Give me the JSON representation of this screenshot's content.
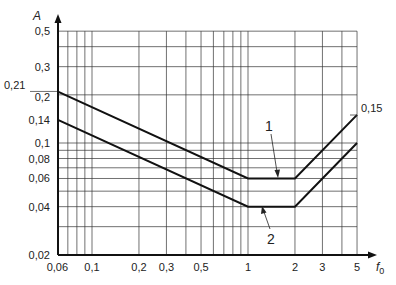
{
  "chart_data": {
    "type": "line",
    "title": "",
    "xlabel": "f0",
    "ylabel": "A",
    "xscale": "log",
    "yscale": "log",
    "xlim": [
      0.06,
      5
    ],
    "ylim": [
      0.02,
      0.5
    ],
    "grid": true,
    "x_tick_labels": [
      "0,06",
      "0,1",
      "0,2",
      "0,3",
      "0,5",
      "1",
      "2",
      "3",
      "5"
    ],
    "x_tick_values": [
      0.06,
      0.1,
      0.2,
      0.3,
      0.5,
      1,
      2,
      3,
      5
    ],
    "x_grid_values": [
      0.07,
      0.08,
      0.09,
      0.1,
      0.2,
      0.3,
      0.4,
      0.5,
      0.6,
      0.7,
      0.8,
      0.9,
      1,
      2,
      3,
      4,
      5
    ],
    "y_tick_labels": [
      "0,5",
      "0,3",
      "0,21",
      "0,2",
      "0,14",
      "0,1",
      "0,08",
      "0,06",
      "0,04",
      "0,02"
    ],
    "y_tick_values": [
      0.5,
      0.3,
      0.21,
      0.2,
      0.14,
      0.1,
      0.08,
      0.06,
      0.04,
      0.02
    ],
    "y_grid_values": [
      0.03,
      0.04,
      0.05,
      0.06,
      0.07,
      0.08,
      0.09,
      0.1,
      0.2,
      0.3,
      0.4,
      0.5
    ],
    "series": [
      {
        "name": "1",
        "x": [
          0.06,
          1,
          2,
          5
        ],
        "y": [
          0.21,
          0.06,
          0.06,
          0.15
        ]
      },
      {
        "name": "2",
        "x": [
          0.06,
          1,
          2,
          5
        ],
        "y": [
          0.14,
          0.04,
          0.04,
          0.1
        ]
      }
    ],
    "annotations": [
      {
        "text": "0,15",
        "x": 5,
        "y": 0.15
      },
      {
        "text": "1",
        "target_series": "1"
      },
      {
        "text": "2",
        "target_series": "2"
      }
    ]
  },
  "axes": {
    "x_label": "f",
    "x_label_sub": "0",
    "y_label": "A"
  },
  "labels": {
    "curve1": "1",
    "curve2": "2",
    "end_value": "0,15"
  }
}
